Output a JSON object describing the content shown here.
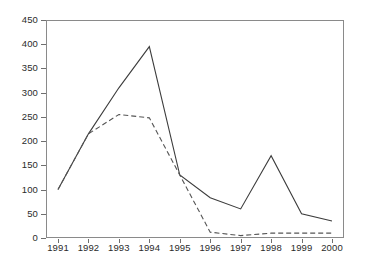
{
  "chart_data": {
    "type": "line",
    "title": "",
    "subtitle": "",
    "xlabel": "",
    "ylabel": "",
    "categories": [
      "1991",
      "1992",
      "1993",
      "1994",
      "1995",
      "1996",
      "1997",
      "1998",
      "1999",
      "2000"
    ],
    "x": [
      1991,
      1992,
      1993,
      1994,
      1995,
      1996,
      1997,
      1998,
      1999,
      2000
    ],
    "ylim": [
      0,
      450
    ],
    "yticks": [
      0,
      50,
      100,
      150,
      200,
      250,
      300,
      350,
      400,
      450
    ],
    "ytick_labels": [
      "0",
      "50",
      "100",
      "150",
      "200",
      "250",
      "300",
      "350",
      "400",
      "450"
    ],
    "grid": false,
    "legend": "none",
    "series": [
      {
        "name": "solid-series",
        "style": "solid",
        "color": "#3c3c3c",
        "values": [
          100,
          215,
          310,
          395,
          130,
          83,
          60,
          170,
          50,
          35
        ]
      },
      {
        "name": "dashed-series",
        "style": "dashed",
        "color": "#555555",
        "values": [
          100,
          215,
          255,
          248,
          130,
          12,
          5,
          10,
          10,
          10
        ]
      }
    ],
    "axis_color": "#8a8a8a",
    "tick_color": "#6f6f6f",
    "text_color": "#2b2b2b",
    "background": "#ffffff"
  }
}
